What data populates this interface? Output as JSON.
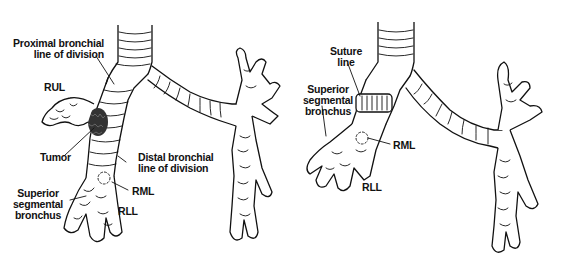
{
  "figure": {
    "panels": [
      {
        "id": "before",
        "labels": {
          "proximal": [
            "Proximal bronchial",
            "line of division"
          ],
          "rul": "RUL",
          "tumor": "Tumor",
          "distal": [
            "Distal bronchial",
            "line of division"
          ],
          "superior": [
            "Superior",
            "segmental",
            "bronchus"
          ],
          "rml": "RML",
          "rll": "RLL"
        }
      },
      {
        "id": "after",
        "labels": {
          "suture": [
            "Suture",
            "line"
          ],
          "superior": [
            "Superior",
            "segmental",
            "bronchus"
          ],
          "rml": "RML",
          "rll": "RLL"
        }
      }
    ]
  }
}
